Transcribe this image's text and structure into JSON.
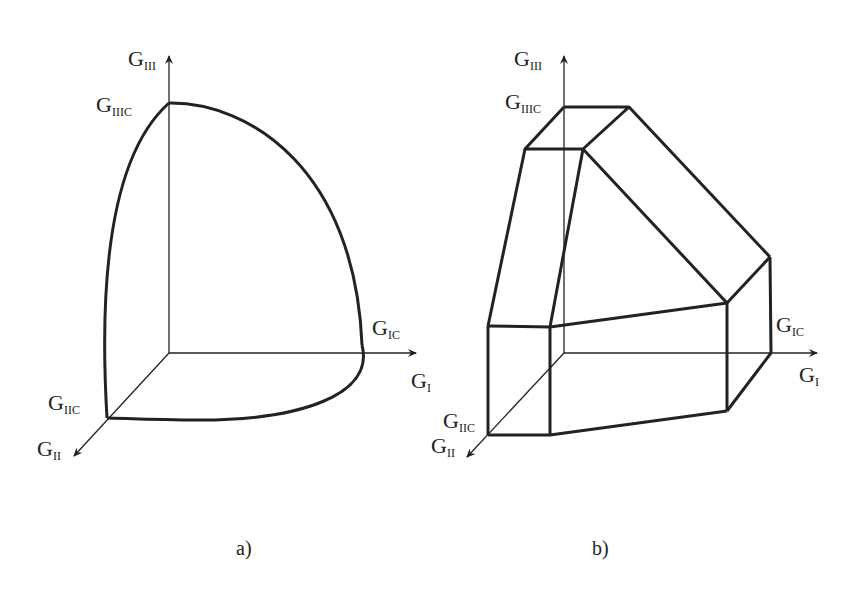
{
  "panels": [
    {
      "id": "a",
      "caption": "a)",
      "shape": "curved failure envelope (ellipsoid octant)",
      "labels": {
        "axis_III": {
          "base": "G",
          "sub": "III"
        },
        "crit_III": {
          "base": "G",
          "sub": "IIIC"
        },
        "crit_I": {
          "base": "G",
          "sub": "IC"
        },
        "axis_I": {
          "base": "G",
          "sub": "I"
        },
        "crit_II": {
          "base": "G",
          "sub": "IIC"
        },
        "axis_II": {
          "base": "G",
          "sub": "II"
        }
      }
    },
    {
      "id": "b",
      "caption": "b)",
      "shape": "piecewise-planar failure envelope (polyhedron)",
      "labels": {
        "axis_III": {
          "base": "G",
          "sub": "III"
        },
        "crit_III": {
          "base": "G",
          "sub": "IIIC"
        },
        "crit_I": {
          "base": "G",
          "sub": "IC"
        },
        "axis_I": {
          "base": "G",
          "sub": "I"
        },
        "crit_II": {
          "base": "G",
          "sub": "IIC"
        },
        "axis_II": {
          "base": "G",
          "sub": "II"
        }
      }
    }
  ],
  "colors": {
    "line": "#222222",
    "background": "#ffffff"
  }
}
